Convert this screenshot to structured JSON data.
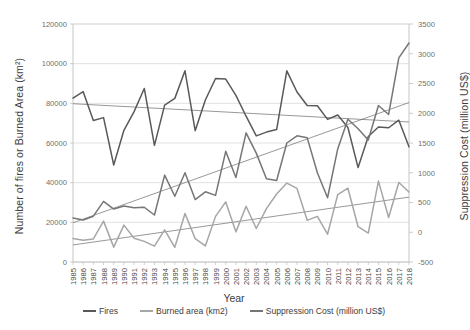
{
  "chart_data": {
    "type": "line",
    "title": "",
    "xlabel": "Year",
    "ylabel": "Number of fires or Burned Area (km²)",
    "y2label": "Suppression Cost (million US$)",
    "grid": true,
    "legend_position": "bottom",
    "ylim": [
      0,
      120000
    ],
    "y_ticks": [
      "0",
      "20000",
      "40000",
      "60000",
      "80000",
      "100000",
      "120000"
    ],
    "y2lim": [
      -500,
      3500
    ],
    "y2_ticks": [
      "-500",
      "0",
      "500",
      "1000",
      "1500",
      "2000",
      "2500",
      "3000",
      "3500"
    ],
    "categories": [
      "1985",
      "1986",
      "1987",
      "1988",
      "1989",
      "1990",
      "1991",
      "1992",
      "1993",
      "1994",
      "1995",
      "1996",
      "1997",
      "1998",
      "1999",
      "2000",
      "2001",
      "2002",
      "2003",
      "2004",
      "2005",
      "2006",
      "2007",
      "2008",
      "2009",
      "2010",
      "2011",
      "2012",
      "2013",
      "2014",
      "2015",
      "2016",
      "2017",
      "2018"
    ],
    "series": [
      {
        "name": "Fires",
        "axis": "left",
        "color": "#595959",
        "values": [
          82600,
          85900,
          71300,
          72800,
          48900,
          66400,
          75800,
          87500,
          58800,
          79100,
          82500,
          96400,
          66200,
          81700,
          92500,
          92250,
          84000,
          73500,
          63600,
          65500,
          66800,
          96400,
          85700,
          78900,
          78800,
          71900,
          74100,
          67800,
          47600,
          63300,
          68100,
          67700,
          71500,
          58100
        ]
      },
      {
        "name": "Burned area (km2)",
        "axis": "left",
        "color": "#a6a6a6",
        "values": [
          11900,
          11000,
          11600,
          20600,
          7500,
          18600,
          12000,
          10400,
          8000,
          16200,
          7400,
          24500,
          11800,
          8100,
          23000,
          30300,
          15200,
          28100,
          16900,
          26900,
          34300,
          39800,
          37100,
          21000,
          23000,
          14000,
          34000,
          37200,
          17800,
          14600,
          40800,
          22400,
          40100,
          35300
        ]
      },
      {
        "name": "Suppression Cost (million US$)",
        "axis": "right",
        "color": "#767676",
        "values": [
          240,
          205,
          270,
          520,
          390,
          440,
          410,
          420,
          290,
          960,
          605,
          1000,
          550,
          680,
          620,
          1360,
          920,
          1670,
          1330,
          900,
          870,
          1500,
          1620,
          1590,
          1000,
          580,
          1400,
          1900,
          1740,
          1550,
          2130,
          1980,
          2930,
          3180
        ]
      }
    ],
    "trendlines": [
      {
        "name": "Fires trend",
        "axis": "left",
        "color": "#6b6b6b",
        "start": 79800,
        "end": 70600
      },
      {
        "name": "Burned area trend",
        "axis": "left",
        "color": "#6b6b6b",
        "start": 8600,
        "end": 32700
      },
      {
        "name": "Suppression Cost trend",
        "axis": "right",
        "color": "#6b6b6b",
        "start": 160,
        "end": 2180
      }
    ]
  },
  "legend": {
    "items": [
      {
        "label": "Fires",
        "color": "#595959"
      },
      {
        "label": "Burned area (km2)",
        "color": "#a6a6a6"
      },
      {
        "label": "Suppression Cost (million US$)",
        "color": "#767676"
      }
    ]
  }
}
